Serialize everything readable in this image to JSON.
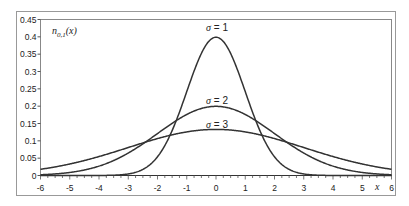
{
  "chart_data": {
    "type": "line",
    "title": "",
    "ylabel_annotation": "n_{0,1}(x)",
    "ylabel_main": "n",
    "ylabel_sub": "0,1",
    "ylabel_arg": "(x)",
    "xlabel": "x",
    "xlim": [
      -6,
      6
    ],
    "ylim": [
      0,
      0.45
    ],
    "grid": false,
    "legend": "none (inline curve labels)",
    "x_ticks": [
      "-6",
      "-5",
      "-4",
      "-3",
      "-2",
      "-1",
      "0",
      "1",
      "2",
      "3",
      "4",
      "5",
      "6"
    ],
    "y_ticks": [
      "0",
      "0.05",
      "0.1",
      "0.15",
      "0.2",
      "0.25",
      "0.3",
      "0.35",
      "0.4",
      "0.45"
    ],
    "series": [
      {
        "name": "σ = 1",
        "sigma": 1,
        "mean": 0,
        "peak": 0.399,
        "x": [
          -6,
          -5,
          -4,
          -3,
          -2,
          -1,
          0,
          1,
          2,
          3,
          4,
          5,
          6
        ],
        "values": [
          0.0,
          0.0,
          0.0001,
          0.0044,
          0.054,
          0.242,
          0.3989,
          0.242,
          0.054,
          0.0044,
          0.0001,
          0.0,
          0.0
        ]
      },
      {
        "name": "σ = 2",
        "sigma": 2,
        "mean": 0,
        "peak": 0.199,
        "x": [
          -6,
          -5,
          -4,
          -3,
          -2,
          -1,
          0,
          1,
          2,
          3,
          4,
          5,
          6
        ],
        "values": [
          0.0022,
          0.0088,
          0.027,
          0.0648,
          0.121,
          0.176,
          0.1995,
          0.176,
          0.121,
          0.0648,
          0.027,
          0.0088,
          0.0022
        ]
      },
      {
        "name": "σ = 3",
        "sigma": 3,
        "mean": 0,
        "peak": 0.133,
        "x": [
          -6,
          -5,
          -4,
          -3,
          -2,
          -1,
          0,
          1,
          2,
          3,
          4,
          5,
          6
        ],
        "values": [
          0.018,
          0.0332,
          0.0547,
          0.0807,
          0.1065,
          0.1258,
          0.133,
          0.1258,
          0.1065,
          0.0807,
          0.0547,
          0.0332,
          0.018
        ]
      }
    ],
    "annotations": [
      {
        "text": "σ = 1",
        "x": 0,
        "y": 0.42
      },
      {
        "text": "σ = 2",
        "x": 0,
        "y": 0.21
      },
      {
        "text": "σ = 3",
        "x": 0,
        "y": 0.14
      }
    ]
  },
  "colors": {
    "curve": "#333333",
    "axis": "#555555",
    "frame": "#999999",
    "background": "#ffffff"
  }
}
